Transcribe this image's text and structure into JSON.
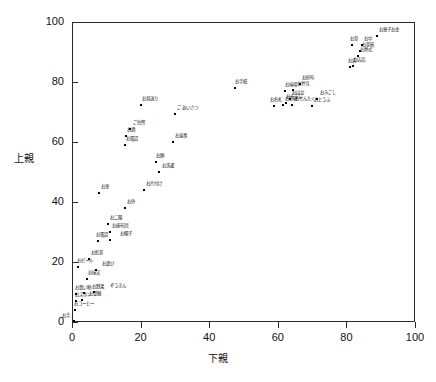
{
  "chart_data": {
    "type": "scatter",
    "title": "",
    "xlabel": "下親",
    "ylabel": "上親",
    "xlim": [
      0,
      100
    ],
    "ylim": [
      0,
      100
    ],
    "xticks": [
      "0",
      "20",
      "40",
      "60",
      "80",
      "100"
    ],
    "yticks": [
      "0",
      "20",
      "40",
      "60",
      "80",
      "100"
    ],
    "xtick_values": [
      0,
      20,
      40,
      60,
      80,
      100
    ],
    "ytick_values": [
      0,
      20,
      40,
      60,
      80,
      100
    ],
    "grid": false,
    "legend": false,
    "points": [
      {
        "label": "お手",
        "x": 0.5,
        "y": 0.3,
        "dx": -12,
        "dy": -3
      },
      {
        "label": "おコーヒー",
        "x": 1.0,
        "y": 4.0,
        "dx": -1,
        "dy": -4
      },
      {
        "label": "おズボン",
        "x": 1.2,
        "y": 7.0,
        "dx": -1,
        "dy": -4
      },
      {
        "label": "お受験",
        "x": 3.0,
        "y": 7.2,
        "dx": 7,
        "dy": -4
      },
      {
        "label": "お買い物",
        "x": 1.3,
        "y": 9.5,
        "dx": -1,
        "dy": -4
      },
      {
        "label": "お野菜",
        "x": 3.5,
        "y": 9.8,
        "dx": 8,
        "dy": -4
      },
      {
        "label": "ぞうきん",
        "x": 6.5,
        "y": 9.9,
        "dx": 16,
        "dy": -4
      },
      {
        "label": "お味実",
        "x": 4.5,
        "y": 14.5,
        "dx": 1,
        "dy": -4
      },
      {
        "label": "おビール",
        "x": 1.8,
        "y": 18.5,
        "dx": -1,
        "dy": -4
      },
      {
        "label": "お遊び",
        "x": 7.0,
        "y": 17.5,
        "dx": 6,
        "dy": -4
      },
      {
        "label": "お紅茶",
        "x": 5.0,
        "y": 21.0,
        "dx": 2,
        "dy": -4
      },
      {
        "label": "お電話",
        "x": 7.5,
        "y": 27.0,
        "dx": -2,
        "dy": -4
      },
      {
        "label": "お帽子",
        "x": 11.0,
        "y": 27.2,
        "dx": 10,
        "dy": -4
      },
      {
        "label": "お座布団",
        "x": 11.0,
        "y": 30.0,
        "dx": 2,
        "dy": -4
      },
      {
        "label": "お二階",
        "x": 10.5,
        "y": 32.8,
        "dx": 2,
        "dy": -4
      },
      {
        "label": "お外",
        "x": 15.5,
        "y": 38.0,
        "dx": 2,
        "dy": -4
      },
      {
        "label": "お車",
        "x": 8.0,
        "y": 43.0,
        "dx": 2,
        "dy": -4
      },
      {
        "label": "お片付け",
        "x": 21.0,
        "y": 44.0,
        "dx": 2,
        "dy": -4
      },
      {
        "label": "お洗濯",
        "x": 25.5,
        "y": 50.0,
        "dx": 3,
        "dy": -4
      },
      {
        "label": "お顔",
        "x": 24.5,
        "y": 53.5,
        "dx": 0,
        "dy": -4
      },
      {
        "label": "お返事",
        "x": 29.5,
        "y": 60.0,
        "dx": 2,
        "dy": -4
      },
      {
        "label": "お電話",
        "x": 15.5,
        "y": 59.0,
        "dx": 1,
        "dy": -4
      },
      {
        "label": "お酒",
        "x": 15.8,
        "y": 62.0,
        "dx": 1,
        "dy": -4
      },
      {
        "label": "ご住所",
        "x": 17.0,
        "y": 64.5,
        "dx": 3,
        "dy": -4
      },
      {
        "label": "ご あいさつ",
        "x": 30.0,
        "y": 69.5,
        "dx": 2,
        "dy": -4
      },
      {
        "label": "お見送り",
        "x": 20.0,
        "y": 72.5,
        "dx": 1,
        "dy": -4
      },
      {
        "label": "お手紙",
        "x": 47.5,
        "y": 78.0,
        "dx": 0,
        "dy": -4
      },
      {
        "label": "お名札",
        "x": 59.0,
        "y": 72.0,
        "dx": -4,
        "dy": -4
      },
      {
        "label": "お砂糖",
        "x": 61.5,
        "y": 72.2,
        "dx": 2,
        "dy": -4
      },
      {
        "label": "おそうじ",
        "x": 62.5,
        "y": 73.0,
        "dx": 0,
        "dy": -4
      },
      {
        "label": "おはな",
        "x": 63.5,
        "y": 74.3,
        "dx": 2,
        "dy": -4
      },
      {
        "label": "おせんたく",
        "x": 64.0,
        "y": 72.5,
        "dx": 3,
        "dy": -4
      },
      {
        "label": "お味噌",
        "x": 62.0,
        "y": 77.0,
        "dx": 0,
        "dy": -4
      },
      {
        "label": "お弁当",
        "x": 64.5,
        "y": 77.2,
        "dx": 4,
        "dy": -4
      },
      {
        "label": "おとうふ",
        "x": 70.0,
        "y": 72.0,
        "dx": 2,
        "dy": -4
      },
      {
        "label": "おみこし",
        "x": 71.5,
        "y": 74.5,
        "dx": 3,
        "dy": -4
      },
      {
        "label": "お砂布",
        "x": 66.5,
        "y": 79.5,
        "dx": 2,
        "dy": -4
      },
      {
        "label": "お店",
        "x": 81.0,
        "y": 85.0,
        "dx": -2,
        "dy": -4
      },
      {
        "label": "お店品",
        "x": 81.8,
        "y": 85.5,
        "dx": 0,
        "dy": -4
      },
      {
        "label": "お葬式",
        "x": 83.5,
        "y": 88.8,
        "dx": 2,
        "dy": -4
      },
      {
        "label": "お茶碗",
        "x": 84.0,
        "y": 90.5,
        "dx": 2,
        "dy": -4
      },
      {
        "label": "お中",
        "x": 84.5,
        "y": 92.5,
        "dx": 2,
        "dy": -4
      },
      {
        "label": "お草",
        "x": 81.5,
        "y": 92.5,
        "dx": -2,
        "dy": -4
      },
      {
        "label": "お菓子お金",
        "x": 89.0,
        "y": 95.5,
        "dx": 2,
        "dy": -4
      }
    ]
  },
  "axes": {
    "y_axis_label": "上親",
    "x_axis_label": "下親"
  }
}
